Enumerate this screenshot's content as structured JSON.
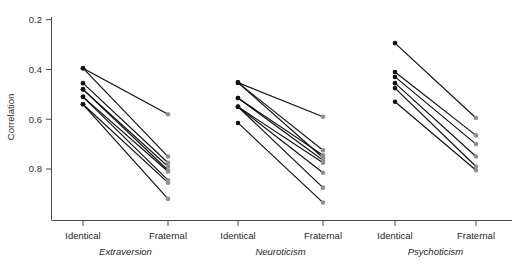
{
  "figure": {
    "background": "#ffffff",
    "width": 517,
    "height": 267
  },
  "axis": {
    "y_title": "Correlation",
    "y_ticks": [
      "0.8",
      "0.6",
      "0.4",
      "0.2"
    ],
    "x_categories": [
      "Identical",
      "Fraternal"
    ]
  },
  "panels": [
    {
      "name": "Extraversion"
    },
    {
      "name": "Neuroticism"
    },
    {
      "name": "Psychoticism"
    }
  ],
  "colors": {
    "identical_point": "#111111",
    "fraternal_point": "#8f8f8f",
    "line": "#0d0d0d",
    "axis": "#4a4a4a"
  },
  "chart_data": {
    "type": "line",
    "title": "",
    "xlabel": "",
    "ylabel": "Correlation",
    "ylim": [
      0.0,
      0.85
    ],
    "yticks": [
      0.2,
      0.4,
      0.6,
      0.8
    ],
    "grid": false,
    "legend": "none",
    "x_categories": [
      "Identical",
      "Fraternal"
    ],
    "panels": [
      {
        "name": "Extraversion",
        "pairs": [
          {
            "identical": 0.605,
            "fraternal": 0.42
          },
          {
            "identical": 0.605,
            "fraternal": 0.25
          },
          {
            "identical": 0.545,
            "fraternal": 0.225
          },
          {
            "identical": 0.52,
            "fraternal": 0.21
          },
          {
            "identical": 0.52,
            "fraternal": 0.195
          },
          {
            "identical": 0.49,
            "fraternal": 0.19
          },
          {
            "identical": 0.49,
            "fraternal": 0.155
          },
          {
            "identical": 0.46,
            "fraternal": 0.145
          },
          {
            "identical": 0.46,
            "fraternal": 0.08
          }
        ]
      },
      {
        "name": "Neuroticism",
        "pairs": [
          {
            "identical": 0.547,
            "fraternal": 0.41
          },
          {
            "identical": 0.547,
            "fraternal": 0.275
          },
          {
            "identical": 0.547,
            "fraternal": 0.245
          },
          {
            "identical": 0.485,
            "fraternal": 0.255
          },
          {
            "identical": 0.485,
            "fraternal": 0.235
          },
          {
            "identical": 0.45,
            "fraternal": 0.225
          },
          {
            "identical": 0.45,
            "fraternal": 0.185
          },
          {
            "identical": 0.45,
            "fraternal": 0.125
          },
          {
            "identical": 0.385,
            "fraternal": 0.065
          }
        ]
      },
      {
        "name": "Psychoticism",
        "pairs": [
          {
            "identical": 0.706,
            "fraternal": 0.405
          },
          {
            "identical": 0.59,
            "fraternal": 0.335
          },
          {
            "identical": 0.57,
            "fraternal": 0.3
          },
          {
            "identical": 0.545,
            "fraternal": 0.25
          },
          {
            "identical": 0.525,
            "fraternal": 0.21
          },
          {
            "identical": 0.47,
            "fraternal": 0.195
          }
        ]
      }
    ]
  }
}
